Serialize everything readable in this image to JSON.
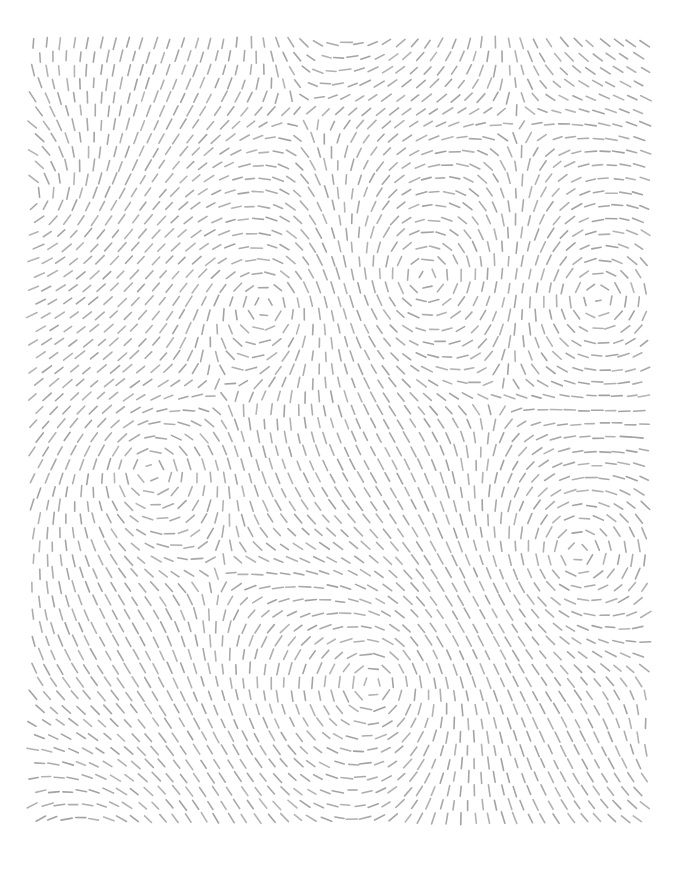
{
  "artwork": {
    "title": "Vortex Flow Field",
    "type": "generative-vector-field",
    "medium": "short-dash-strokes",
    "canvas": {
      "width": 679,
      "height": 878,
      "background_color": "#ffffff"
    },
    "content_bounds": {
      "left": 33,
      "top": 43,
      "right": 646,
      "bottom": 831
    },
    "stroke": {
      "color": "#9c9c9c",
      "width": 1.6,
      "dash_length": 10.5,
      "linecap": "round",
      "opacity": 0.95
    },
    "grid": {
      "spacing": 13.6,
      "jitter": 1.2,
      "description": "Regular lattice of sample points; each point draws one short dash tangent to the local flow direction."
    },
    "field": {
      "model": "sum-of-rotational-singularities",
      "description": "Direction at each sample point is the angle of the summed contribution of every vortex; each vortex contributes a perpendicular (rotational) unit vector weighted by strength divided by distance.",
      "falloff_exponent": 1.0,
      "base_flow_angle_deg": 0,
      "base_flow_weight": 0.22
    },
    "singularities": [
      {
        "name": "vortex-top-center-offscreen",
        "x": 352,
        "y": -52,
        "strength": 1.15,
        "spin": 1,
        "visible_core": false
      },
      {
        "name": "vortex-left-edge",
        "x": 24,
        "y": 196,
        "strength": 0.95,
        "spin": -1,
        "visible_core": false
      },
      {
        "name": "vortex-mid-left",
        "x": 265,
        "y": 305,
        "strength": 1.3,
        "spin": 1,
        "visible_core": true
      },
      {
        "name": "vortex-upper-center",
        "x": 425,
        "y": 277,
        "strength": 1.55,
        "spin": -1,
        "visible_core": true
      },
      {
        "name": "vortex-right-edge-upper",
        "x": 598,
        "y": 298,
        "strength": 1.1,
        "spin": 1,
        "visible_core": true
      },
      {
        "name": "vortex-lower-right",
        "x": 578,
        "y": 553,
        "strength": 1.45,
        "spin": -1,
        "visible_core": true
      },
      {
        "name": "vortex-bottom-center",
        "x": 373,
        "y": 684,
        "strength": 1.5,
        "spin": 1,
        "visible_core": true
      },
      {
        "name": "vortex-bottom-left-offscreen",
        "x": 96,
        "y": 905,
        "strength": 1.0,
        "spin": -1,
        "visible_core": false
      },
      {
        "name": "vortex-mid-left-lower",
        "x": 150,
        "y": 470,
        "strength": 0.7,
        "spin": 1,
        "visible_core": false
      },
      {
        "name": "vortex-right-edge-lower",
        "x": 690,
        "y": 760,
        "strength": 0.85,
        "spin": -1,
        "visible_core": false
      }
    ],
    "counts": {
      "singularity_count": 10,
      "visible_core_count": 5
    }
  }
}
